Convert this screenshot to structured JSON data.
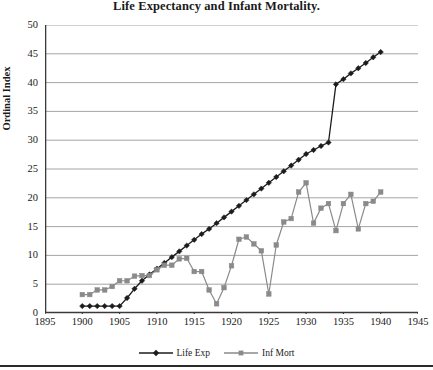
{
  "chart_data": {
    "type": "line",
    "title": "Life Expectancy and Infant Mortality.",
    "xlabel": "",
    "ylabel": "Ordinal Index",
    "xlim": [
      1895,
      1945
    ],
    "ylim": [
      0,
      50
    ],
    "xticks": [
      1895,
      1900,
      1905,
      1910,
      1915,
      1920,
      1925,
      1930,
      1935,
      1940,
      1945
    ],
    "yticks": [
      0,
      5,
      10,
      15,
      20,
      25,
      30,
      35,
      40,
      45,
      50
    ],
    "grid": "horizontal",
    "legend_position": "bottom",
    "x": [
      1900,
      1901,
      1902,
      1903,
      1904,
      1905,
      1906,
      1907,
      1908,
      1909,
      1910,
      1911,
      1912,
      1913,
      1914,
      1915,
      1916,
      1917,
      1918,
      1919,
      1920,
      1921,
      1922,
      1923,
      1924,
      1925,
      1926,
      1927,
      1928,
      1929,
      1930,
      1931,
      1932,
      1933,
      1934,
      1935,
      1936,
      1937,
      1938,
      1939,
      1940
    ],
    "series": [
      {
        "name": "Life Exp",
        "marker": "diamond",
        "color": "#1c1c1c",
        "values": [
          1.2,
          1.2,
          1.2,
          1.2,
          1.2,
          1.2,
          2.6,
          4.2,
          5.6,
          6.7,
          7.7,
          8.7,
          9.7,
          10.7,
          11.7,
          12.7,
          13.7,
          14.6,
          15.6,
          16.6,
          17.6,
          18.6,
          19.6,
          20.6,
          21.6,
          22.6,
          23.6,
          24.6,
          25.6,
          26.6,
          27.6,
          28.3,
          29.0,
          29.6,
          39.7,
          40.6,
          41.6,
          42.5,
          43.4,
          44.4,
          45.3
        ]
      },
      {
        "name": "Inf Mort",
        "marker": "square",
        "color": "#8a8a8a",
        "values": [
          3.2,
          3.2,
          4.0,
          4.0,
          4.6,
          5.6,
          5.6,
          6.4,
          6.5,
          6.5,
          7.5,
          8.3,
          8.3,
          9.4,
          9.5,
          7.2,
          7.2,
          4.0,
          1.6,
          4.4,
          8.2,
          12.8,
          13.2,
          12.0,
          10.8,
          3.3,
          11.8,
          15.8,
          16.4,
          21.0,
          22.6,
          15.6,
          18.2,
          19.0,
          14.3,
          19.0,
          20.6,
          14.6,
          19.0,
          19.4,
          21.0
        ]
      }
    ]
  }
}
